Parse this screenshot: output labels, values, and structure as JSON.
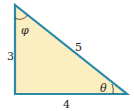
{
  "diagram": {
    "type": "right-triangle",
    "fill_color": "#fbeec0",
    "stroke_color": "#2a8aa8",
    "sides": {
      "vertical": "3",
      "hypotenuse": "5",
      "horizontal": "4"
    },
    "angles": {
      "top": "φ",
      "bottom_right": "θ"
    }
  }
}
